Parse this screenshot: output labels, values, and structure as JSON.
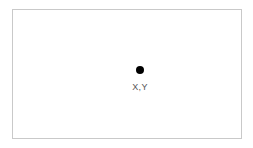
{
  "canvas": {
    "width": 253,
    "height": 148,
    "background_color": "#ffffff",
    "frame": {
      "border_color": "#c9c9c9",
      "border_width": 1,
      "fill_color": "#ffffff",
      "left": 12,
      "top": 9,
      "width": 230,
      "height": 130
    }
  },
  "point": {
    "marker_icon": "filled-circle-icon",
    "marker_color": "#000000",
    "marker_diameter": 8,
    "center_x": 127,
    "center_y": 60,
    "label": "X,Y",
    "label_color": "#555555"
  }
}
